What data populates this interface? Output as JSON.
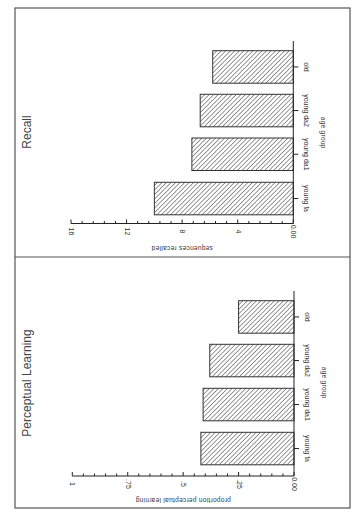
{
  "chart_data": [
    {
      "type": "bar",
      "orientation": "rotated-90-clockwise",
      "title": "Recall",
      "xlabel": "age group",
      "ylabel": "sequences recalled",
      "categories": [
        "young fa",
        "young da1",
        "young da2",
        "old"
      ],
      "values": [
        10.0,
        7.3,
        6.7,
        5.8
      ],
      "ylim": [
        0,
        16
      ],
      "yticks": [
        0,
        4,
        8,
        12,
        16
      ],
      "ytick_labels": [
        "0.00",
        "4",
        "8",
        "12",
        "16"
      ],
      "minor_ticks_per_interval": 4,
      "grid": false,
      "legend": null,
      "fill": "diagonal-hatch"
    },
    {
      "type": "bar",
      "orientation": "rotated-90-clockwise",
      "title": "Perceptual Learning",
      "xlabel": "age group",
      "ylabel": "proportion perceptual learning",
      "categories": [
        "young fa",
        "young da1",
        "young da2",
        "old"
      ],
      "values": [
        0.42,
        0.41,
        0.38,
        0.25
      ],
      "ylim": [
        0,
        1
      ],
      "yticks": [
        0,
        0.25,
        0.5,
        0.75,
        1
      ],
      "ytick_labels": [
        "0.00",
        ".25",
        ".5",
        ".75",
        "1"
      ],
      "minor_ticks_per_interval": 4,
      "grid": false,
      "legend": null,
      "fill": "diagonal-hatch"
    }
  ],
  "panels": [
    {
      "title": "Recall",
      "xlabel": "age group",
      "ylabel": "sequences recalled"
    },
    {
      "title": "Perceptual Learning",
      "xlabel": "age group",
      "ylabel": "proportion perceptual learning"
    }
  ],
  "colors": {
    "frame": "#555555",
    "axis": "#222222",
    "bar_stroke": "#333333",
    "hatch": "#333333",
    "background": "#ffffff"
  }
}
